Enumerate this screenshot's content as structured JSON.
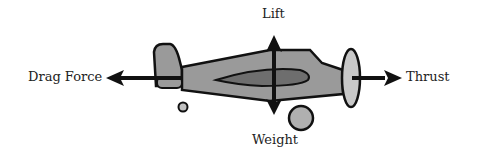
{
  "diagram": {
    "forces": {
      "drag": "Drag Force",
      "lift": "Lift",
      "thrust": "Thrust",
      "weight": "Weight"
    },
    "colors": {
      "fuselage": "#9a9a9a",
      "wing": "#6e6e6e",
      "propeller": "#c8c8c8",
      "outline": "#111111",
      "arrow": "#111111"
    }
  }
}
